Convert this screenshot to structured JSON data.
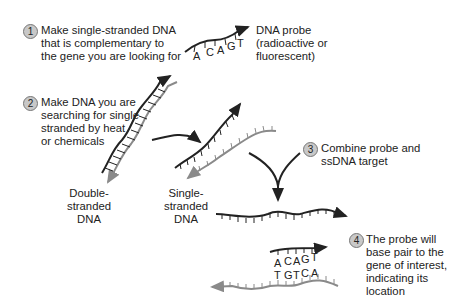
{
  "steps": [
    {
      "number": "1",
      "text": "Make single-stranded DNA\nthat is complementary to\nthe gene you are looking for"
    },
    {
      "number": "2",
      "text": "Make DNA you are\nsearching for single\nstranded by heat\nor chemicals"
    },
    {
      "number": "3",
      "text": "Combine probe and\nssDNA target"
    },
    {
      "number": "4",
      "text": "The probe will\nbase pair to the\ngene of interest,\nindicating its\nlocation"
    }
  ],
  "labels": {
    "probe": "DNA probe\n(radioactive or\nfluorescent)",
    "double_stranded": "Double-stranded\nDNA",
    "single_stranded": "Single-stranded\nDNA"
  },
  "probe_bases": [
    "A",
    "C",
    "A",
    "G",
    "T"
  ],
  "target_bases": [
    "T",
    "G",
    "T",
    "C",
    "A"
  ],
  "colors": {
    "probe_strand": "#222222",
    "target_strand": "#8a8a8a",
    "step_circle": "#c8c8c8"
  }
}
